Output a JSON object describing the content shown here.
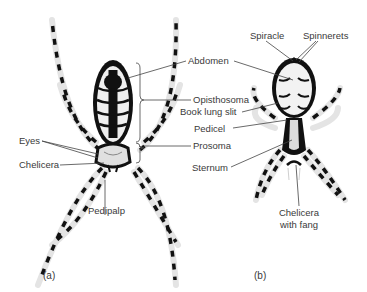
{
  "figure": {
    "panels": [
      {
        "id": "a",
        "caption": "(a)",
        "view": "dorsal",
        "labels": {
          "abdomen": "Abdomen",
          "opisthosoma": "Opisthosoma",
          "prosoma": "Prosoma",
          "eyes": "Eyes",
          "chelicera": "Chelicera",
          "pedipalp": "Pedipalp"
        }
      },
      {
        "id": "b",
        "caption": "(b)",
        "view": "ventral",
        "labels": {
          "spiracle": "Spiracle",
          "spinnerets": "Spinnerets",
          "book_lung_slit": "Book lung slit",
          "pedicel": "Pedicel",
          "sternum": "Sternum",
          "chelicera_line1": "Chelicera",
          "chelicera_line2": "with fang"
        }
      }
    ],
    "colors": {
      "ink": "#111111",
      "label_text": "#3a3a3a",
      "leader_line": "#444444",
      "body_light": "#e6e6e6",
      "background": "#ffffff"
    }
  }
}
